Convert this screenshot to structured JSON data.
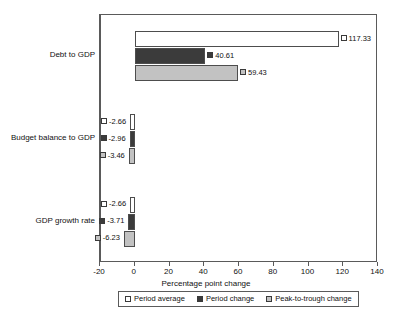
{
  "chart_data": {
    "type": "bar",
    "orientation": "horizontal",
    "title": "",
    "xlabel": "Percentage point change",
    "ylabel": "",
    "xlim": [
      -20,
      140
    ],
    "xticks": [
      -20,
      0,
      20,
      40,
      60,
      80,
      100,
      120,
      140
    ],
    "xtick_labels": [
      "-20",
      "0",
      "20",
      "40",
      "60",
      "80",
      "100",
      "120",
      "140"
    ],
    "grid": false,
    "legend_position": "bottom",
    "categories": [
      "Debt to GDP",
      "Budget balance to GDP",
      "GDP growth rate"
    ],
    "series": [
      {
        "name": "Period average",
        "color": "#ffffff",
        "values": [
          117.33,
          -2.66,
          -2.66
        ],
        "labels": [
          "117.33",
          "-2.66",
          "-2.66"
        ]
      },
      {
        "name": "Period change",
        "color": "#3b3b3b",
        "values": [
          40.61,
          -2.96,
          -3.71
        ],
        "labels": [
          "40.61",
          "-2.96",
          "-3.71"
        ]
      },
      {
        "name": "Peak-to-trough change",
        "color": "#c2c2c2",
        "values": [
          59.43,
          -3.46,
          -6.23
        ],
        "labels": [
          "59.43",
          "-3.46",
          "-6.23"
        ]
      }
    ]
  }
}
